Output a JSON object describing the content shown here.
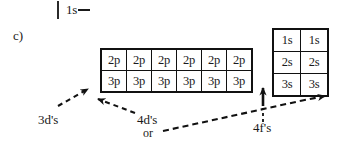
{
  "figure": {
    "part_label": "c)",
    "top_stub": {
      "orbital": "1s",
      "dash": ""
    },
    "p_grid": {
      "rows": [
        {
          "cells": [
            "2p",
            "2p",
            "2p",
            "2p",
            "2p",
            "2p"
          ]
        },
        {
          "cells": [
            "3p",
            "3p",
            "3p",
            "3p",
            "3p",
            "3p"
          ]
        }
      ]
    },
    "s_grid": {
      "rows": [
        {
          "cells": [
            "1s",
            "1s"
          ]
        },
        {
          "cells": [
            "2s",
            "2s"
          ]
        },
        {
          "cells": [
            "3s",
            "3s"
          ]
        }
      ]
    },
    "annotations": {
      "three_d": "3d's",
      "four_d": "4d's",
      "or": "or",
      "four_f": "4f's"
    },
    "colors": {
      "ink": "#1a1a1a",
      "border": "#111111",
      "background": "#ffffff"
    }
  }
}
